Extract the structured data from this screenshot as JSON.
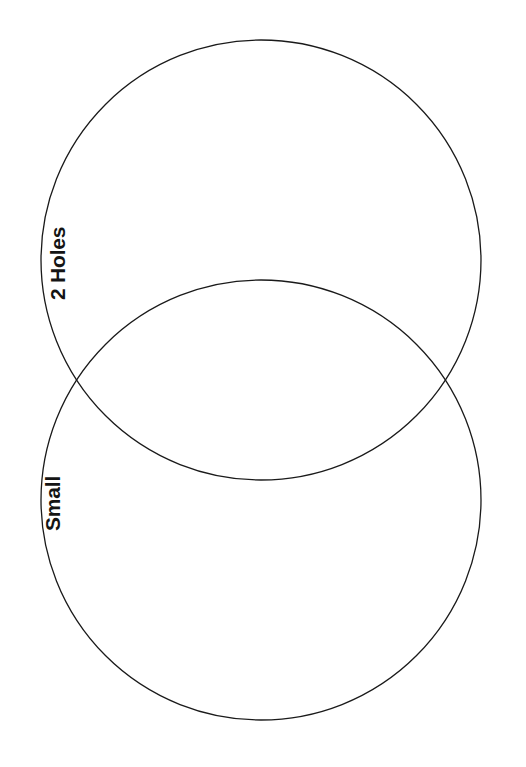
{
  "document": {
    "type": "venn-diagram-worksheet",
    "background_color": "#ffffff",
    "stroke_color": "#1a1a1a",
    "text_color": "#141414",
    "width": 526,
    "height": 767
  },
  "chart_data": {
    "type": "venn",
    "title": "",
    "subtitle": "",
    "xlabel": "",
    "ylabel": "",
    "grid": false,
    "legend_position": "inline-left",
    "set_count": 2,
    "orientation": "vertical",
    "sets": [
      {
        "id": "set-2-holes",
        "label": "2 Holes",
        "label_rotation_deg": -90,
        "center_x": 261,
        "center_y": 260,
        "radius": 220,
        "fill": "none",
        "stroke": "#1a1a1a",
        "items": []
      },
      {
        "id": "set-small",
        "label": "Small",
        "label_rotation_deg": -90,
        "center_x": 261,
        "center_y": 500,
        "radius": 220,
        "fill": "none",
        "stroke": "#1a1a1a",
        "items": []
      }
    ],
    "intersection": {
      "label": "",
      "items": []
    }
  },
  "labels": {
    "upper": "2 Holes",
    "lower": "Small"
  }
}
